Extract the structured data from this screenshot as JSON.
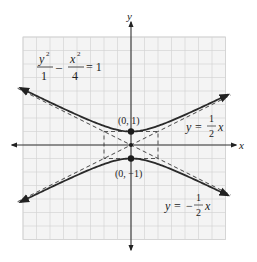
{
  "diagram": {
    "type": "hyperbola-graph",
    "equation": {
      "num1": "y",
      "exp1": "2",
      "den1": "1",
      "minus": "–",
      "num2": "x",
      "exp2": "2",
      "den2": "4",
      "equals": "= 1"
    },
    "axes": {
      "x_label": "x",
      "y_label": "y",
      "x_range": [
        -8,
        7
      ],
      "y_range": [
        -7,
        8
      ],
      "grid_step": 1
    },
    "hyperbola": {
      "a": 1,
      "b": 2,
      "orientation": "vertical"
    },
    "vertices": [
      {
        "x": 0,
        "y": 1,
        "label": "(0, 1)"
      },
      {
        "x": 0,
        "y": -1,
        "label": "(0, −1)"
      }
    ],
    "center_point": {
      "x": 0,
      "y": 0
    },
    "fundamental_rectangle": {
      "x": [
        -2,
        2
      ],
      "y": [
        -1,
        1
      ]
    },
    "asymptotes": [
      {
        "slope": 0.5,
        "label_lhs": "y =",
        "label_num": "1",
        "label_den": "2",
        "label_var": "x",
        "label_sign": ""
      },
      {
        "slope": -0.5,
        "label_lhs": "y =",
        "label_num": "1",
        "label_den": "2",
        "label_var": "x",
        "label_sign": "−"
      }
    ],
    "colors": {
      "curve": "#2a2a2a",
      "grid": "#d4d4d4",
      "background": "#f4f4f4"
    }
  }
}
